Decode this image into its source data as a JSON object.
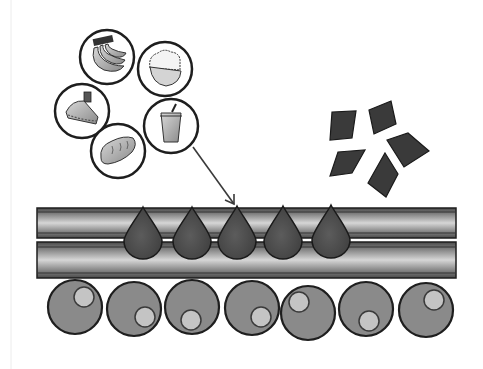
{
  "diagram": {
    "title": "Glucose absorption from food into the bloodstream",
    "colors": {
      "background": "#ffffff",
      "outline": "#1e1e1e",
      "tube_dark": "#5a5a5a",
      "tube_mid": "#8c8c8c",
      "tube_light": "#d2d2d2",
      "droplet": "#4a4a4a",
      "cell": "#8a8a8a",
      "nucleus": "#c4c4c4",
      "crystal": "#3a3a3a",
      "food_icon": "#9a9a9a",
      "arrow": "#3a3a3a"
    },
    "food_items": [
      {
        "name": "bananas",
        "cx": 107,
        "cy": 57,
        "r": 27
      },
      {
        "name": "rice-bowl",
        "cx": 165,
        "cy": 69,
        "r": 27
      },
      {
        "name": "cake-slice",
        "cx": 82,
        "cy": 111,
        "r": 27
      },
      {
        "name": "drink-cup",
        "cx": 171,
        "cy": 126,
        "r": 27
      },
      {
        "name": "bread-loaf",
        "cx": 118,
        "cy": 151,
        "r": 27
      }
    ],
    "arrow": {
      "x1": 193,
      "y1": 147,
      "x2": 234,
      "y2": 204
    },
    "crystals": [
      {
        "name": "crystal-1",
        "points": "332,112 356,111 352,138 330,140"
      },
      {
        "name": "crystal-2",
        "points": "369,110 391,101 396,124 374,134"
      },
      {
        "name": "crystal-3",
        "points": "387,140 408,133 429,151 404,167"
      },
      {
        "name": "crystal-4",
        "points": "338,152 365,150 352,173 330,176"
      },
      {
        "name": "crystal-5",
        "points": "385,153 398,174 386,197 368,183"
      }
    ],
    "vessel": {
      "x": 37,
      "width": 419,
      "upper": {
        "y": 208,
        "height": 30
      },
      "lower": {
        "y": 242,
        "height": 36
      }
    },
    "droplets": [
      {
        "cx": 143,
        "tip_y": 207,
        "bottom_y": 258
      },
      {
        "cx": 192,
        "tip_y": 207,
        "bottom_y": 258
      },
      {
        "cx": 237,
        "tip_y": 206,
        "bottom_y": 258
      },
      {
        "cx": 283,
        "tip_y": 206,
        "bottom_y": 258
      },
      {
        "cx": 331,
        "tip_y": 205,
        "bottom_y": 257
      }
    ],
    "cells": [
      {
        "cx": 75,
        "cy": 307,
        "r": 27,
        "ncx": 84,
        "ncy": 297,
        "nr": 10
      },
      {
        "cx": 134,
        "cy": 309,
        "r": 27,
        "ncx": 145,
        "ncy": 317,
        "nr": 10
      },
      {
        "cx": 192,
        "cy": 307,
        "r": 27,
        "ncx": 191,
        "ncy": 320,
        "nr": 10
      },
      {
        "cx": 252,
        "cy": 308,
        "r": 27,
        "ncx": 261,
        "ncy": 317,
        "nr": 10
      },
      {
        "cx": 308,
        "cy": 313,
        "r": 27,
        "ncx": 299,
        "ncy": 302,
        "nr": 10
      },
      {
        "cx": 366,
        "cy": 309,
        "r": 27,
        "ncx": 369,
        "ncy": 321,
        "nr": 10
      },
      {
        "cx": 426,
        "cy": 310,
        "r": 27,
        "ncx": 434,
        "ncy": 300,
        "nr": 10
      }
    ]
  }
}
